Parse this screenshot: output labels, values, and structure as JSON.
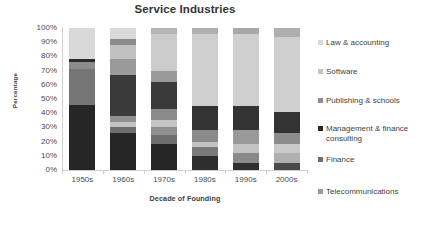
{
  "chart_data": {
    "type": "bar",
    "subtype": "stacked-100-percent",
    "title": "Service Industries",
    "xlabel": "Decade of Founding",
    "ylabel": "Percentage",
    "categories": [
      "1950s",
      "1960s",
      "1970s",
      "1980s",
      "1990s",
      "2000s"
    ],
    "ylim": [
      0,
      100
    ],
    "ytick_labels": [
      "0%",
      "10%",
      "20%",
      "30%",
      "40%",
      "50%",
      "60%",
      "70%",
      "80%",
      "90%",
      "100%"
    ],
    "ytick_values": [
      0,
      10,
      20,
      30,
      40,
      50,
      60,
      70,
      80,
      90,
      100
    ],
    "grid": false,
    "legend_position": "right",
    "stack_order_bottom_to_top": [
      "Telecommunications",
      "Finance",
      "Management & finance consulting",
      "Publishing & schools",
      "Software",
      "Law & accounting"
    ],
    "series": [
      {
        "name": "Telecommunications",
        "color": "#8c8c8c",
        "values": [
          0,
          4,
          4,
          4,
          4,
          4
        ]
      },
      {
        "name": "Finance",
        "color": "#595959",
        "values": [
          0,
          0,
          7,
          6,
          7,
          7
        ]
      },
      {
        "name": "Management & finance consulting",
        "color": "#262626",
        "values": [
          46,
          26,
          7,
          6,
          4,
          0
        ]
      },
      {
        "name": "Publishing & schools",
        "color": "#757575",
        "values": [
          30,
          4,
          5,
          8,
          8,
          8
        ]
      },
      {
        "name": "Software",
        "color": "#bfbfbf",
        "values": [
          0,
          4,
          5,
          4,
          6,
          7
        ]
      },
      {
        "name": "Law & accounting",
        "color": "#d9d9d9",
        "values": [
          24,
          62,
          72,
          72,
          71,
          74
        ]
      }
    ],
    "bars": [
      {
        "category": "1950s",
        "segments": [
          {
            "name": "Management & finance consulting",
            "start": 0,
            "end": 46,
            "color": "#262626"
          },
          {
            "name": "Publishing & schools",
            "start": 46,
            "end": 71,
            "color": "#757575"
          },
          {
            "name": "Telecommunications",
            "start": 71,
            "end": 76,
            "color": "#8c8c8c"
          },
          {
            "name": "Management & finance consulting",
            "start": 76,
            "end": 78,
            "color": "#2b2b2b"
          },
          {
            "name": "Law & accounting",
            "start": 78,
            "end": 100,
            "color": "#d9d9d9"
          }
        ]
      },
      {
        "category": "1960s",
        "segments": [
          {
            "name": "Management & finance consulting",
            "start": 0,
            "end": 26,
            "color": "#262626"
          },
          {
            "name": "Finance",
            "start": 26,
            "end": 30,
            "color": "#6e6e6e"
          },
          {
            "name": "Software",
            "start": 30,
            "end": 34,
            "color": "#c4c4c4"
          },
          {
            "name": "Publishing & schools",
            "start": 34,
            "end": 38,
            "color": "#8f8f8f"
          },
          {
            "name": "Management & finance consulting",
            "start": 38,
            "end": 67,
            "color": "#3a3a3a"
          },
          {
            "name": "Publishing & schools",
            "start": 67,
            "end": 78,
            "color": "#9a9a9a"
          },
          {
            "name": "Software",
            "start": 78,
            "end": 88,
            "color": "#c0c0c0"
          },
          {
            "name": "Telecommunications",
            "start": 88,
            "end": 92,
            "color": "#8c8c8c"
          },
          {
            "name": "Law & accounting",
            "start": 92,
            "end": 100,
            "color": "#d9d9d9"
          }
        ]
      },
      {
        "category": "1970s",
        "segments": [
          {
            "name": "Management & finance consulting",
            "start": 0,
            "end": 18,
            "color": "#262626"
          },
          {
            "name": "Finance",
            "start": 18,
            "end": 25,
            "color": "#6e6e6e"
          },
          {
            "name": "Telecommunications",
            "start": 25,
            "end": 30,
            "color": "#8f8f8f"
          },
          {
            "name": "Software",
            "start": 30,
            "end": 35,
            "color": "#c4c4c4"
          },
          {
            "name": "Publishing & schools",
            "start": 35,
            "end": 43,
            "color": "#8a8a8a"
          },
          {
            "name": "Management & finance consulting",
            "start": 43,
            "end": 62,
            "color": "#3a3a3a"
          },
          {
            "name": "Publishing & schools",
            "start": 62,
            "end": 70,
            "color": "#9a9a9a"
          },
          {
            "name": "Law & accounting",
            "start": 70,
            "end": 96,
            "color": "#cccccc"
          },
          {
            "name": "Telecommunications",
            "start": 96,
            "end": 100,
            "color": "#b5b5b5"
          }
        ]
      },
      {
        "category": "1980s",
        "segments": [
          {
            "name": "Management & finance consulting",
            "start": 0,
            "end": 10,
            "color": "#2e2e2e"
          },
          {
            "name": "Finance",
            "start": 10,
            "end": 16,
            "color": "#7a7a7a"
          },
          {
            "name": "Software",
            "start": 16,
            "end": 20,
            "color": "#c4c4c4"
          },
          {
            "name": "Publishing & schools",
            "start": 20,
            "end": 28,
            "color": "#8a8a8a"
          },
          {
            "name": "Management & finance consulting",
            "start": 28,
            "end": 45,
            "color": "#333333"
          },
          {
            "name": "Law & accounting",
            "start": 45,
            "end": 96,
            "color": "#cfcfcf"
          },
          {
            "name": "Telecommunications",
            "start": 96,
            "end": 100,
            "color": "#b0b0b0"
          }
        ]
      },
      {
        "category": "1990s",
        "segments": [
          {
            "name": "Telecommunications",
            "start": 0,
            "end": 5,
            "color": "#2e2e2e"
          },
          {
            "name": "Finance",
            "start": 5,
            "end": 12,
            "color": "#8a8a8a"
          },
          {
            "name": "Software",
            "start": 12,
            "end": 18,
            "color": "#c4c4c4"
          },
          {
            "name": "Publishing & schools",
            "start": 18,
            "end": 28,
            "color": "#999999"
          },
          {
            "name": "Management & finance consulting",
            "start": 28,
            "end": 45,
            "color": "#333333"
          },
          {
            "name": "Law & accounting",
            "start": 45,
            "end": 96,
            "color": "#cfcfcf"
          },
          {
            "name": "Telecommunications",
            "start": 96,
            "end": 100,
            "color": "#a8a8a8"
          }
        ]
      },
      {
        "category": "2000s",
        "segments": [
          {
            "name": "Telecommunications",
            "start": 0,
            "end": 5,
            "color": "#4a4a4a"
          },
          {
            "name": "Finance",
            "start": 5,
            "end": 12,
            "color": "#b0b0b0"
          },
          {
            "name": "Software",
            "start": 12,
            "end": 18,
            "color": "#c9c9c9"
          },
          {
            "name": "Publishing & schools",
            "start": 18,
            "end": 26,
            "color": "#8c8c8c"
          },
          {
            "name": "Management & finance consulting",
            "start": 26,
            "end": 41,
            "color": "#333333"
          },
          {
            "name": "Law & accounting",
            "start": 41,
            "end": 94,
            "color": "#cfcfcf"
          },
          {
            "name": "Telecommunications",
            "start": 94,
            "end": 100,
            "color": "#aeaeae"
          }
        ]
      }
    ]
  },
  "legend": {
    "items": [
      {
        "label": "Law & accounting",
        "color": "#d9d9d9",
        "top": 6
      },
      {
        "label": "Software",
        "color": "#c4c4c4",
        "top": 35
      },
      {
        "label": "Publishing & schools",
        "color": "#8f8f8f",
        "top": 64
      },
      {
        "label": "Management & finance\nconsulting",
        "color": "#262626",
        "top": 92
      },
      {
        "label": "Finance",
        "color": "#6e6e6e",
        "top": 123
      },
      {
        "label": "Telecommunications",
        "color": "#9a9a9a",
        "top": 155
      }
    ]
  }
}
